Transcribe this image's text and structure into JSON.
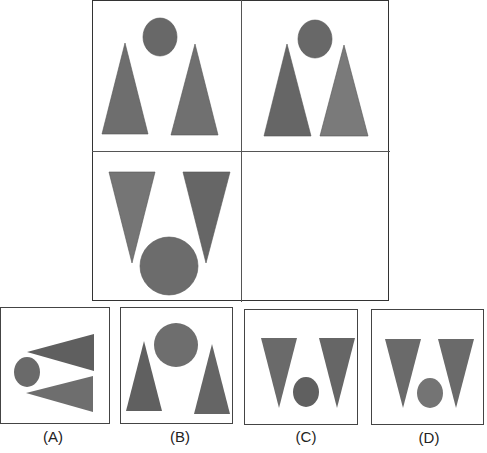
{
  "puzzle": {
    "type": "2x2 figure matrix with missing cell",
    "colors": {
      "shape_fill": "#6a6a6a",
      "shape_fill_alt": "#777777",
      "border": "#333333",
      "background": "#ffffff"
    },
    "grid": {
      "cells": [
        {
          "position": "top-left",
          "shapes": [
            "circle-top-center",
            "triangle-up-left",
            "triangle-up-right"
          ]
        },
        {
          "position": "top-right",
          "shapes": [
            "circle-top-center",
            "triangle-up-left",
            "triangle-up-right"
          ]
        },
        {
          "position": "bottom-left",
          "shapes": [
            "triangle-down-left",
            "triangle-down-right",
            "circle-bottom-center-large"
          ]
        },
        {
          "position": "bottom-right",
          "shapes": [],
          "missing": true
        }
      ]
    },
    "options": [
      {
        "label": "(A)",
        "shapes": [
          "circle-left",
          "triangle-left-pointing-top",
          "triangle-left-pointing-bottom"
        ]
      },
      {
        "label": "(B)",
        "shapes": [
          "circle-top-center-large",
          "triangle-up-left",
          "triangle-up-right"
        ]
      },
      {
        "label": "(C)",
        "shapes": [
          "triangle-down-left",
          "triangle-down-right",
          "circle-bottom-center-small"
        ]
      },
      {
        "label": "(D)",
        "shapes": [
          "triangle-down-left",
          "triangle-down-right",
          "circle-bottom-center-small"
        ]
      }
    ]
  }
}
